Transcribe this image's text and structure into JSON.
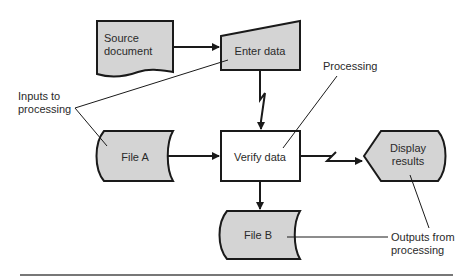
{
  "diagram": {
    "type": "system flowchart",
    "nodes": {
      "source_document": {
        "label_line1": "Source",
        "label_line2": "document",
        "shape": "document"
      },
      "enter_data": {
        "label": "Enter data",
        "shape": "manual-input"
      },
      "file_a": {
        "label": "File A",
        "shape": "stored-data"
      },
      "verify_data": {
        "label": "Verify data",
        "shape": "process"
      },
      "display_results": {
        "label_line1": "Display",
        "label_line2": "results",
        "shape": "display"
      },
      "file_b": {
        "label": "File B",
        "shape": "stored-data"
      }
    },
    "annotations": {
      "inputs": {
        "line1": "Inputs to",
        "line2": "processing"
      },
      "processing": {
        "label": "Processing"
      },
      "outputs": {
        "line1": "Outputs from",
        "line2": "processing"
      }
    },
    "edges": [
      {
        "from": "source_document",
        "to": "enter_data",
        "style": "solid"
      },
      {
        "from": "enter_data",
        "to": "verify_data",
        "style": "communication-link"
      },
      {
        "from": "file_a",
        "to": "verify_data",
        "style": "solid"
      },
      {
        "from": "verify_data",
        "to": "display_results",
        "style": "communication-link"
      },
      {
        "from": "verify_data",
        "to": "file_b",
        "style": "solid"
      }
    ],
    "colors": {
      "shape_fill": "#d4d4d4",
      "process_fill": "#ffffff",
      "stroke": "#1a1a1a",
      "rule": "#777777"
    }
  }
}
